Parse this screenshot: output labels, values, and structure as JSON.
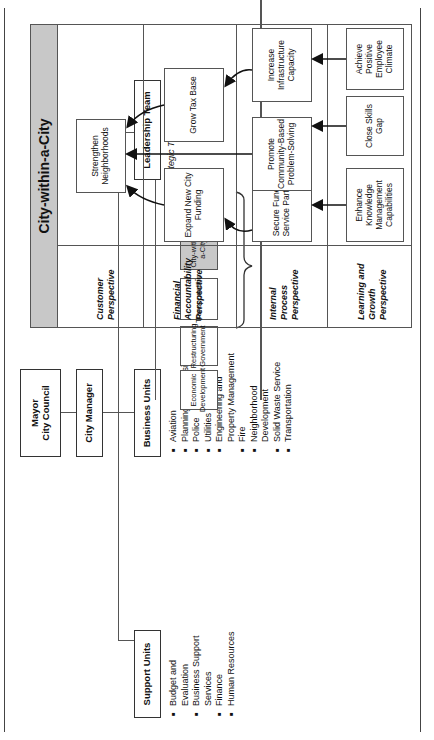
{
  "org_chart": {
    "top": "Mayor\nCity Council",
    "top_lines": [
      "Mayor",
      "City Council"
    ],
    "manager": "City Manager",
    "support_units": {
      "title": "Support Units",
      "items": [
        "Budget and Evaluation",
        "Business Support Services",
        "Finance",
        "Human Resources"
      ]
    },
    "business_units": {
      "title": "Business Units",
      "items": [
        "Aviation",
        "Planning Commission",
        "Police",
        "Utilities",
        "Engineering and Property Management",
        "Fire",
        "Neighborhood Development",
        "Solid Waste Service",
        "Transportation"
      ]
    },
    "leadership_team": {
      "title": "Leadership Team",
      "themes_label": "Strategic Themes",
      "themes": [
        "Community Safety",
        "City-within-a-City",
        "Transportation",
        "Restructuring Government",
        "Economic Development"
      ],
      "highlighted_theme": "City-within-a-City"
    }
  },
  "strategy_map": {
    "title": "City-within-a-City",
    "perspectives": [
      {
        "name": "Customer Perspective",
        "objectives": [
          "Strengthen Neighborhoods"
        ]
      },
      {
        "name": "Financial Accountability Perspective",
        "objectives": [
          "Expand New City Funding",
          "Grow Tax Base"
        ]
      },
      {
        "name": "Internal Process Perspective",
        "objectives": [
          "Secure Funding/ Service Partners",
          "Promote Community-Based Problem-Solving",
          "Increase Infrastructure Capacity"
        ]
      },
      {
        "name": "Learning and Growth Perspective",
        "objectives": [
          "Enhance Knowledge Management Capabilities",
          "Close Skills Gap",
          "Achieve Positive Employee Climate"
        ]
      }
    ]
  },
  "colors": {
    "highlight_gray": "#c8c8c8",
    "line": "#555555",
    "text": "#111111"
  }
}
